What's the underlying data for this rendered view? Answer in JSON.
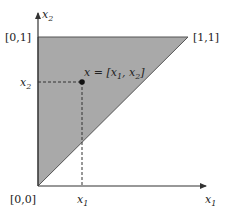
{
  "diagram": {
    "type": "unit-square-triangle-region",
    "colors": {
      "region_fill": "#a9a9a9",
      "region_edge": "#555555",
      "axis": "#333333",
      "dashed": "#333333",
      "point": "#111111",
      "background": "#ffffff"
    },
    "axes": {
      "x_label": "x",
      "x_label_sub": "1",
      "y_label": "x",
      "y_label_sub": "2"
    },
    "corners": {
      "origin": "[0,0]",
      "top_left": "[0,1]",
      "top_right": "[1,1]"
    },
    "point": {
      "label_prefix": "x = [x",
      "label_sub1": "1",
      "label_mid": ", x",
      "label_sub2": "2",
      "label_suffix": "]"
    },
    "ticks": {
      "x_tick": "x",
      "x_tick_sub": "1",
      "y_tick": "x",
      "y_tick_sub": "2"
    }
  }
}
